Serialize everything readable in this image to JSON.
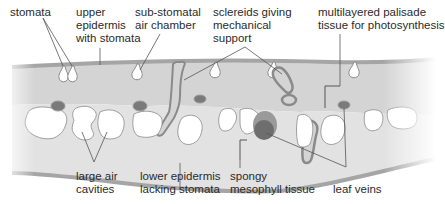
{
  "diagram": {
    "colors": {
      "tissue_fill": "#d6d6d6",
      "epidermis": "#a9a9a9",
      "outline": "#8a8a8a",
      "vein_dark": "#6e6e6e",
      "vein_light": "#9a9a9a",
      "label_text": "#2b2b2b",
      "leader_line": "#555555",
      "background": "#ffffff"
    },
    "labels": {
      "stomata": "stomata",
      "upper_epidermis": "upper\nepidermis\nwith stomata",
      "sub_stomatal": "sub-stomatal\nair chamber",
      "sclereids": "sclereids giving\nmechanical\nsupport",
      "palisade": "multilayered palisade\ntissue for photosynthesis",
      "air_cavities": "large air\ncavities",
      "lower_epidermis": "lower epidermis\nlacking stomata",
      "spongy": "spongy\nmesophyll tissue",
      "leaf_veins": "leaf veins"
    }
  }
}
